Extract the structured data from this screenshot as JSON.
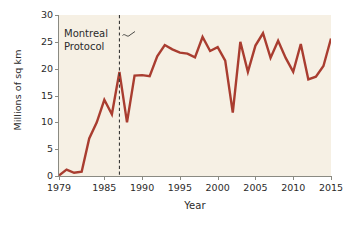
{
  "chart_data": {
    "type": "line",
    "title": "",
    "xlabel": "Year",
    "ylabel": "Millions of sq km",
    "xlim": [
      1979,
      2015
    ],
    "ylim": [
      0,
      30
    ],
    "yticks": [
      0,
      5,
      10,
      15,
      20,
      25,
      30
    ],
    "xticks": [
      1979,
      1985,
      1990,
      1995,
      2000,
      2005,
      2010,
      2015
    ],
    "grid": false,
    "legend_position": "none",
    "line_color": "#a93d30",
    "plot_background": "#f6f0e4",
    "axis_color": "#8a8a82",
    "text_color": "#2b2b2b",
    "annotations": [
      {
        "name": "montreal-protocol",
        "text_line1": "Montreal",
        "text_line2": "Protocol",
        "x": 1987,
        "style": "dashed-vertical-line"
      }
    ],
    "x": [
      1979,
      1980,
      1981,
      1982,
      1983,
      1984,
      1985,
      1986,
      1987,
      1988,
      1989,
      1990,
      1991,
      1992,
      1993,
      1994,
      1995,
      1996,
      1997,
      1998,
      1999,
      2000,
      2001,
      2002,
      2003,
      2004,
      2005,
      2006,
      2007,
      2008,
      2009,
      2010,
      2011,
      2012,
      2013,
      2014,
      2015
    ],
    "values": [
      0.1,
      1.2,
      0.6,
      0.8,
      7.0,
      10.0,
      14.2,
      11.5,
      19.4,
      10.0,
      18.7,
      18.8,
      18.6,
      22.3,
      24.4,
      23.6,
      23.0,
      22.8,
      22.1,
      25.9,
      23.3,
      24.0,
      21.5,
      11.8,
      25.0,
      19.4,
      24.3,
      26.6,
      22.0,
      25.2,
      22.0,
      19.4,
      24.6,
      18.0,
      18.5,
      20.5,
      25.6
    ]
  }
}
